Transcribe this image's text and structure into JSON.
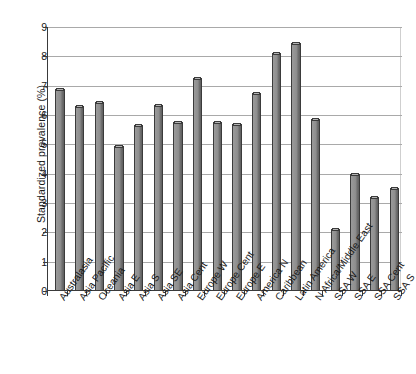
{
  "chart_data": {
    "type": "bar",
    "title": "",
    "subtitle": "",
    "xlabel": "",
    "ylabel": "Standardized prevalence (%)",
    "ylim": [
      0,
      9
    ],
    "ytick_labels": [
      "0",
      "1",
      "2",
      "3",
      "4",
      "5",
      "6",
      "7",
      "8",
      "9"
    ],
    "ytick_values": [
      0,
      1,
      2,
      3,
      4,
      5,
      6,
      7,
      8,
      9
    ],
    "grid": true,
    "grid_axis": "y",
    "legend": null,
    "legend_position": "none",
    "annotations": [],
    "bar_color": "#8e8e8e",
    "bar_edge_color": "#3b3b3b",
    "categories": [
      "Australasia",
      "Asia Pacific",
      "Oceania",
      "Asia E",
      "Asia S",
      "Asia SE",
      "Asia Cent",
      "Europe W",
      "Europe Cent",
      "Europe E",
      "America N",
      "Caribbean",
      "Latin America",
      "N Africa/Middle East",
      "SSA W",
      "SSA E",
      "SSA Cent",
      "SSA S"
    ],
    "values": [
      6.9,
      6.3,
      6.45,
      4.95,
      5.65,
      6.35,
      5.75,
      7.25,
      5.75,
      5.7,
      6.75,
      8.1,
      8.45,
      5.85,
      2.1,
      4.0,
      3.2,
      3.5
    ]
  }
}
